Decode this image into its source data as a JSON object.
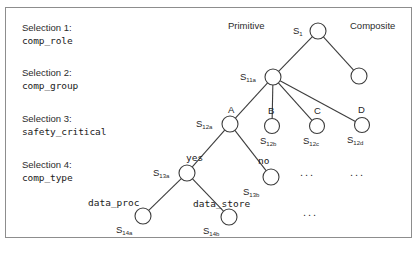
{
  "figure": {
    "title": "",
    "background": "#ffffff",
    "frame_color": "#8d8d8d",
    "node_stroke": "#3c3c3c",
    "edge_stroke": "#3c3c3c"
  },
  "selections": [
    {
      "title": "Selection 1:",
      "value": "comp_role",
      "x": 22,
      "y": 21
    },
    {
      "title": "Selection 2:",
      "value": "comp_group",
      "x": 22,
      "y": 66
    },
    {
      "title": "Selection 3:",
      "value": "safety_critical",
      "x": 22,
      "y": 112
    },
    {
      "title": "Selection 4:",
      "value": "comp_type",
      "x": 22,
      "y": 158
    }
  ],
  "column_headers": [
    {
      "label": "Primitive",
      "x": 228,
      "y": 20
    },
    {
      "label": "Composite",
      "x": 350,
      "y": 20
    }
  ],
  "nodes": [
    {
      "id": "s1",
      "label": "S",
      "sub": "1",
      "cx": 318,
      "cy": 31,
      "r": 8,
      "label_x": 293,
      "label_y": 25
    },
    {
      "id": "comp1",
      "label": "",
      "sub": "",
      "cx": 359,
      "cy": 76,
      "r": 8,
      "label_x": 0,
      "label_y": 0
    },
    {
      "id": "s11a",
      "label": "S",
      "sub": "11a",
      "cx": 273,
      "cy": 77,
      "r": 8,
      "label_x": 240,
      "label_y": 71
    },
    {
      "id": "s12a",
      "label": "S",
      "sub": "12a",
      "cx": 230,
      "cy": 124,
      "r": 8,
      "label_x": 196,
      "label_y": 118
    },
    {
      "id": "s12b",
      "label": "S",
      "sub": "12b",
      "cx": 272,
      "cy": 126,
      "r": 7.5,
      "label_x": 260,
      "label_y": 135
    },
    {
      "id": "s12c",
      "label": "S",
      "sub": "12c",
      "cx": 317,
      "cy": 126,
      "r": 7.5,
      "label_x": 303,
      "label_y": 135
    },
    {
      "id": "s12d",
      "label": "S",
      "sub": "12d",
      "cx": 362,
      "cy": 125,
      "r": 7.5,
      "label_x": 347,
      "label_y": 134
    },
    {
      "id": "s13a",
      "label": "S",
      "sub": "13a",
      "cx": 187,
      "cy": 173,
      "r": 8,
      "label_x": 153,
      "label_y": 167
    },
    {
      "id": "s13b",
      "label": "S",
      "sub": "13b",
      "cx": 271,
      "cy": 177,
      "r": 8,
      "label_x": 243,
      "label_y": 186
    },
    {
      "id": "s14a",
      "label": "S",
      "sub": "14a",
      "cx": 143,
      "cy": 216,
      "r": 8,
      "label_x": 116,
      "label_y": 224
    },
    {
      "id": "s14b",
      "label": "S",
      "sub": "14b",
      "cx": 229,
      "cy": 217,
      "r": 8,
      "label_x": 203,
      "label_y": 225
    }
  ],
  "edges": [
    {
      "from": "s1",
      "to": "s11a"
    },
    {
      "from": "s1",
      "to": "comp1"
    },
    {
      "from": "s11a",
      "to": "s12a"
    },
    {
      "from": "s11a",
      "to": "s12b"
    },
    {
      "from": "s11a",
      "to": "s12c"
    },
    {
      "from": "s11a",
      "to": "s12d"
    },
    {
      "from": "s12a",
      "to": "s13a"
    },
    {
      "from": "s12a",
      "to": "s13b"
    },
    {
      "from": "s13a",
      "to": "s14a"
    },
    {
      "from": "s13a",
      "to": "s14b"
    }
  ],
  "branch_letters": [
    {
      "label": "A",
      "x": 228,
      "y": 104
    },
    {
      "label": "B",
      "x": 268,
      "y": 105
    },
    {
      "label": "C",
      "x": 314,
      "y": 105
    },
    {
      "label": "D",
      "x": 358,
      "y": 104
    }
  ],
  "edge_labels": [
    {
      "label": "yes",
      "x": 186,
      "y": 152
    },
    {
      "label": "no",
      "x": 258,
      "y": 155
    },
    {
      "label": "data_proc",
      "x": 88,
      "y": 197
    },
    {
      "label": "data_store",
      "x": 193,
      "y": 198
    }
  ],
  "ellipses": [
    {
      "label": "...",
      "x": 300,
      "y": 166
    },
    {
      "label": "...",
      "x": 350,
      "y": 166
    },
    {
      "label": "...",
      "x": 303,
      "y": 206
    }
  ]
}
